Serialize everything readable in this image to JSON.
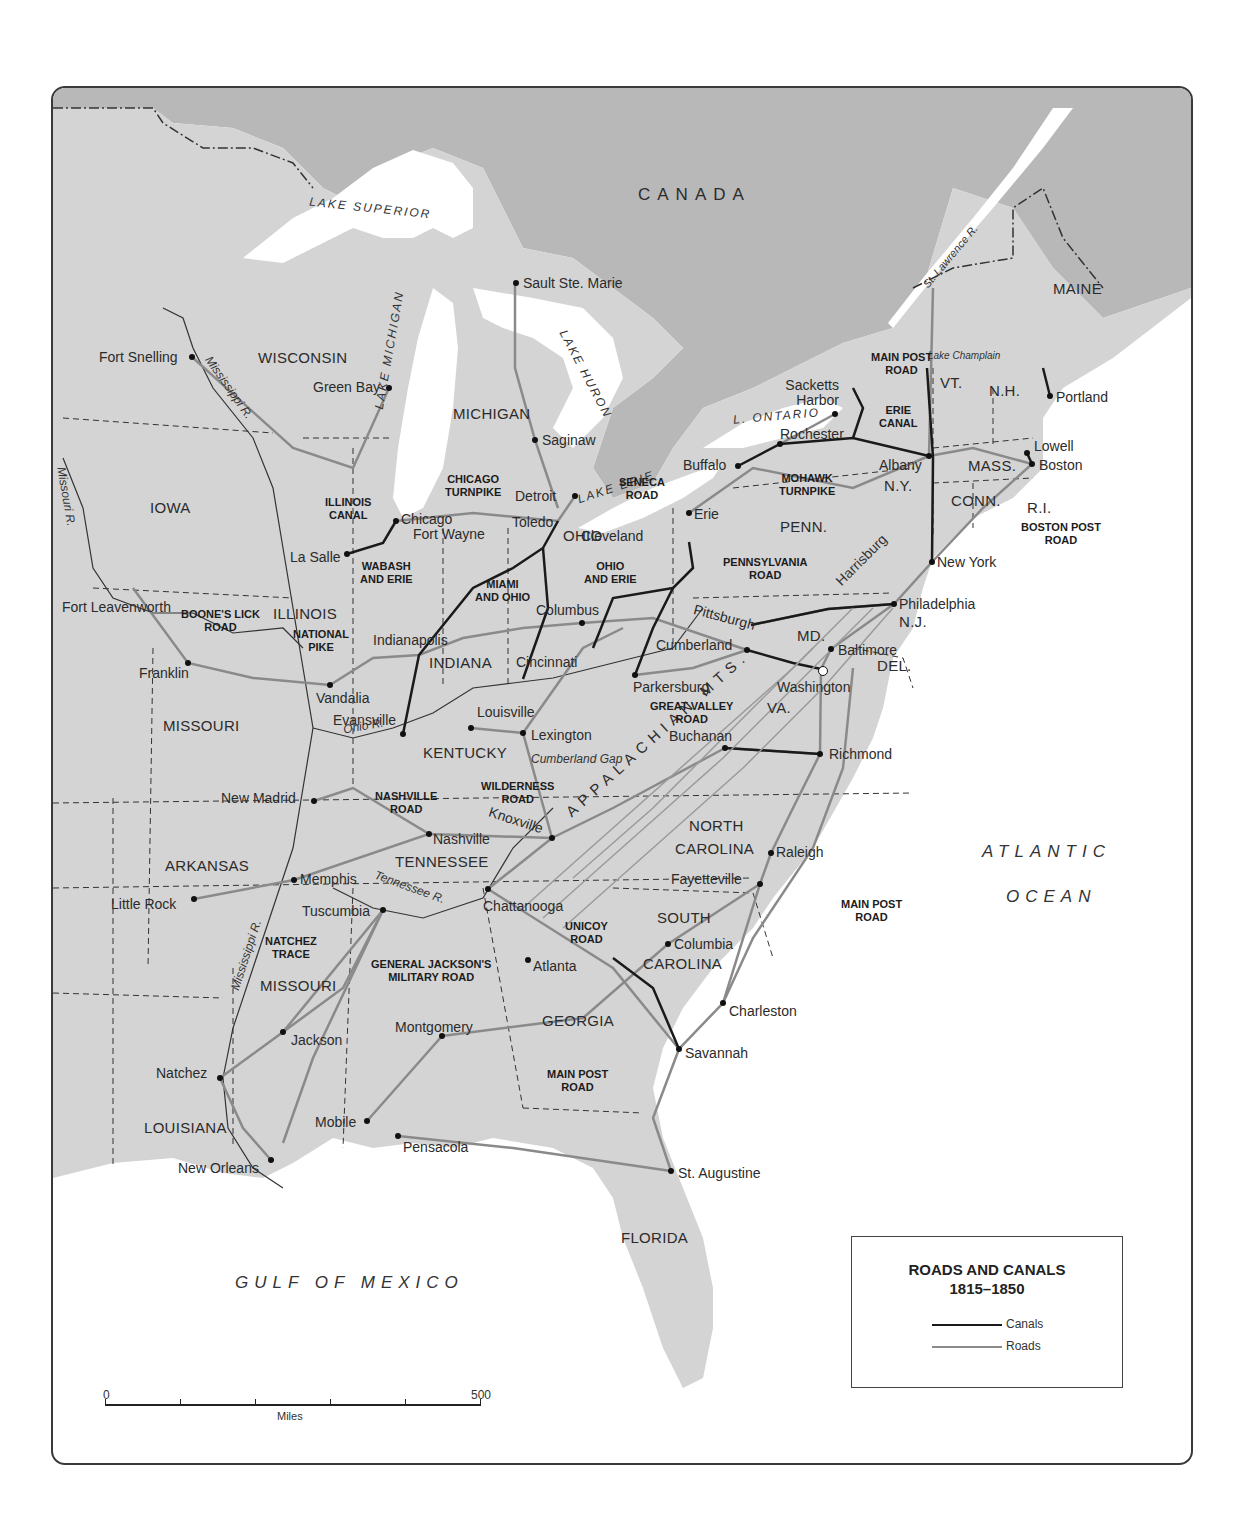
{
  "map": {
    "title": "ROADS AND CANALS",
    "subtitle": "1815–1850",
    "colors": {
      "land_us": "#d4d4d4",
      "land_canada": "#b6b6b6",
      "water": "#ffffff",
      "canal": "#1a1a1a",
      "road": "#8a8a8a",
      "border": "#3a3a3a"
    }
  },
  "legend": {
    "title": "ROADS AND CANALS",
    "years": "1815–1850",
    "items": [
      {
        "label": "Canals",
        "style": "dark-line"
      },
      {
        "label": "Roads",
        "style": "gray-line"
      }
    ]
  },
  "scale": {
    "start": "0",
    "end": "500",
    "unit": "Miles"
  },
  "regions": {
    "country": "CANADA",
    "oceans": [
      "ATLANTIC",
      "OCEAN"
    ],
    "gulf": "GULF OF MEXICO"
  },
  "water_bodies": {
    "lake_superior": "LAKE SUPERIOR",
    "lake_michigan": "LAKE MICHIGAN",
    "lake_huron": "LAKE HURON",
    "lake_erie": "LAKE ERIE",
    "lake_ontario": "L. ONTARIO",
    "lake_champlain": "Lake Champlain"
  },
  "rivers": {
    "mississippi_north": "Mississippi R.",
    "mississippi_south": "Mississippi R.",
    "missouri": "Missouri R.",
    "ohio": "Ohio R.",
    "tennessee": "Tennessee R.",
    "st_lawrence": "St. Lawrence R."
  },
  "terrain": {
    "appalachian": "APPALACHIAN MTS.",
    "cumberland_gap": "Cumberland Gap"
  },
  "states": {
    "wisconsin": "WISCONSIN",
    "michigan": "MICHIGAN",
    "iowa": "IOWA",
    "illinois": "ILLINOIS",
    "indiana": "INDIANA",
    "ohio": "OHIO",
    "missouri": "MISSOURI",
    "kentucky": "KENTUCKY",
    "tennessee": "TENNESSEE",
    "arkansas": "ARKANSAS",
    "mississippi": "MISSOURI",
    "louisiana": "LOUISIANA",
    "georgia": "GEORGIA",
    "florida": "FLORIDA",
    "north_carolina_1": "NORTH",
    "north_carolina_2": "CAROLINA",
    "south_carolina_1": "SOUTH",
    "south_carolina_2": "CAROLINA",
    "virginia": "VA.",
    "maryland": "MD.",
    "delaware": "DEL.",
    "new_jersey": "N.J.",
    "pennsylvania": "PENN.",
    "new_york": "N.Y.",
    "vermont": "VT.",
    "new_hampshire": "N.H.",
    "maine": "MAINE",
    "massachusetts": "MASS.",
    "connecticut": "CONN.",
    "rhode_island": "R.I."
  },
  "cities": [
    {
      "name": "Sault Ste. Marie",
      "x": 463,
      "y": 195
    },
    {
      "name": "Fort Snelling",
      "x": 139,
      "y": 269
    },
    {
      "name": "Green Bay",
      "x": 336,
      "y": 300
    },
    {
      "name": "Saginaw",
      "x": 482,
      "y": 352
    },
    {
      "name": "Detroit",
      "x": 522,
      "y": 408
    },
    {
      "name": "Chicago",
      "x": 343,
      "y": 433
    },
    {
      "name": "Toledo",
      "x": 505,
      "y": 433
    },
    {
      "name": "La Salle",
      "x": 294,
      "y": 466
    },
    {
      "name": "Fort Wayne",
      "x": 394,
      "y": 456
    },
    {
      "name": "Cleveland",
      "x": 635,
      "y": 454
    },
    {
      "name": "Buffalo",
      "x": 685,
      "y": 378
    },
    {
      "name": "Erie",
      "x": 636,
      "y": 425
    },
    {
      "name": "Rochester",
      "x": 727,
      "y": 356
    },
    {
      "name": "Sacketts Harbor",
      "x": 782,
      "y": 326
    },
    {
      "name": "Albany",
      "x": 876,
      "y": 368
    },
    {
      "name": "Portland",
      "x": 997,
      "y": 308
    },
    {
      "name": "Lowell",
      "x": 974,
      "y": 365
    },
    {
      "name": "Boston",
      "x": 979,
      "y": 376
    },
    {
      "name": "New York",
      "x": 879,
      "y": 474
    },
    {
      "name": "Philadelphia",
      "x": 841,
      "y": 516
    },
    {
      "name": "Harrisburg",
      "x": 775,
      "y": 521
    },
    {
      "name": "Baltimore",
      "x": 778,
      "y": 561
    },
    {
      "name": "Washington",
      "x": 768,
      "y": 581
    },
    {
      "name": "Pittsburgh",
      "x": 698,
      "y": 537
    },
    {
      "name": "Cumberland",
      "x": 694,
      "y": 562
    },
    {
      "name": "Parkersburg",
      "x": 582,
      "y": 587
    },
    {
      "name": "Columbus",
      "x": 529,
      "y": 535
    },
    {
      "name": "Cincinnati",
      "x": 470,
      "y": 591
    },
    {
      "name": "Indianapolis",
      "x": 366,
      "y": 567
    },
    {
      "name": "Vandalia",
      "x": 277,
      "y": 597
    },
    {
      "name": "Franklin",
      "x": 135,
      "y": 575
    },
    {
      "name": "Fort Leavenworth",
      "x": 104,
      "y": 510
    },
    {
      "name": "Evansville",
      "x": 350,
      "y": 646
    },
    {
      "name": "Louisville",
      "x": 418,
      "y": 640
    },
    {
      "name": "Lexington",
      "x": 470,
      "y": 645
    },
    {
      "name": "Buchanan",
      "x": 672,
      "y": 660
    },
    {
      "name": "Richmond",
      "x": 767,
      "y": 666
    },
    {
      "name": "New Madrid",
      "x": 261,
      "y": 713
    },
    {
      "name": "Nashville",
      "x": 376,
      "y": 746
    },
    {
      "name": "Knoxville",
      "x": 499,
      "y": 750
    },
    {
      "name": "Memphis",
      "x": 241,
      "y": 792
    },
    {
      "name": "Little Rock",
      "x": 141,
      "y": 811
    },
    {
      "name": "Tuscumbia",
      "x": 330,
      "y": 822
    },
    {
      "name": "Chattanooga",
      "x": 435,
      "y": 801
    },
    {
      "name": "Raleigh",
      "x": 718,
      "y": 765
    },
    {
      "name": "Fayetteville",
      "x": 707,
      "y": 796
    },
    {
      "name": "Columbia",
      "x": 615,
      "y": 856
    },
    {
      "name": "Atlanta",
      "x": 475,
      "y": 872
    },
    {
      "name": "Charleston",
      "x": 670,
      "y": 915
    },
    {
      "name": "Savannah",
      "x": 626,
      "y": 961
    },
    {
      "name": "Montgomery",
      "x": 389,
      "y": 948
    },
    {
      "name": "Jackson",
      "x": 230,
      "y": 944
    },
    {
      "name": "Natchez",
      "x": 167,
      "y": 990
    },
    {
      "name": "Mobile",
      "x": 314,
      "y": 1033
    },
    {
      "name": "Pensacola",
      "x": 345,
      "y": 1048
    },
    {
      "name": "New Orleans",
      "x": 218,
      "y": 1072
    },
    {
      "name": "St. Augustine",
      "x": 618,
      "y": 1083
    }
  ],
  "routes": [
    {
      "name": "MAIN POST ROAD",
      "type": "road",
      "location": "upstate-ny"
    },
    {
      "name": "ERIE CANAL",
      "type": "canal"
    },
    {
      "name": "MOHAWK TURNPIKE",
      "type": "road"
    },
    {
      "name": "SENECA ROAD",
      "type": "road"
    },
    {
      "name": "BOSTON POST ROAD",
      "type": "road"
    },
    {
      "name": "PENNSYLVANIA ROAD",
      "type": "road"
    },
    {
      "name": "CHICAGO TURNPIKE",
      "type": "road"
    },
    {
      "name": "ILLINOIS CANAL",
      "type": "canal"
    },
    {
      "name": "WABASH AND ERIE",
      "type": "canal"
    },
    {
      "name": "MIAMI AND OHIO",
      "type": "canal"
    },
    {
      "name": "OHIO AND ERIE",
      "type": "canal"
    },
    {
      "name": "NATIONAL PIKE",
      "type": "road"
    },
    {
      "name": "BOONE'S LICK ROAD",
      "type": "road"
    },
    {
      "name": "GREAT VALLEY ROAD",
      "type": "road"
    },
    {
      "name": "WILDERNESS ROAD",
      "type": "road"
    },
    {
      "name": "NASHVILLE ROAD",
      "type": "road"
    },
    {
      "name": "NATCHEZ TRACE",
      "type": "road"
    },
    {
      "name": "GENERAL JACKSON'S MILITARY ROAD",
      "type": "road"
    },
    {
      "name": "UNICOY ROAD",
      "type": "road"
    },
    {
      "name": "MAIN POST ROAD",
      "type": "road",
      "location": "carolinas"
    },
    {
      "name": "MAIN POST ROAD",
      "type": "road",
      "location": "georgia"
    }
  ]
}
